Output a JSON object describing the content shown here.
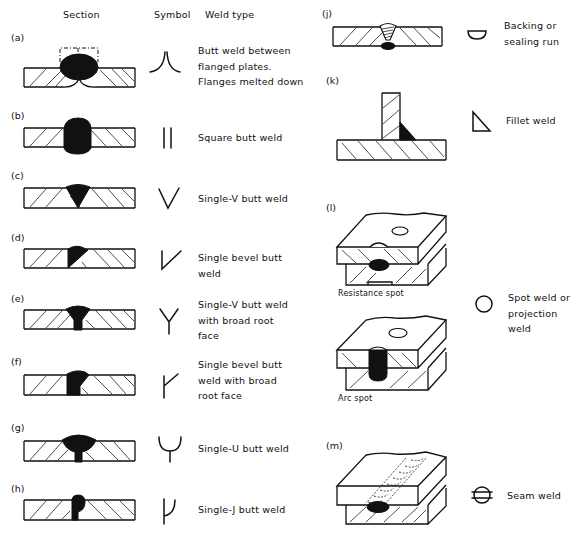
{
  "headers": {
    "section": "Section",
    "symbol": "Symbol",
    "weld_type": "Weld type"
  },
  "left_items": [
    {
      "label": "(a)",
      "symbol_icon": "flanged-butt-symbol",
      "lines": [
        "Butt weld between",
        "flanged plates.",
        "Flanges melted down"
      ]
    },
    {
      "label": "(b)",
      "symbol_icon": "square-butt-symbol",
      "lines": [
        "Square butt weld"
      ]
    },
    {
      "label": "(c)",
      "symbol_icon": "single-v-symbol",
      "lines": [
        "Single-V butt weld"
      ]
    },
    {
      "label": "(d)",
      "symbol_icon": "single-bevel-symbol",
      "lines": [
        "Single bevel butt",
        "weld"
      ]
    },
    {
      "label": "(e)",
      "symbol_icon": "single-v-broad-root-symbol",
      "lines": [
        "Single-V butt weld",
        "with broad root",
        "face"
      ]
    },
    {
      "label": "(f)",
      "symbol_icon": "single-bevel-broad-root-symbol",
      "lines": [
        "Single bevel butt",
        "weld with broad",
        "root face"
      ]
    },
    {
      "label": "(g)",
      "symbol_icon": "single-u-symbol",
      "lines": [
        "Single-U butt weld"
      ]
    },
    {
      "label": "(h)",
      "symbol_icon": "single-j-symbol",
      "lines": [
        "Single-J butt weld"
      ]
    }
  ],
  "right_items": [
    {
      "label": "(j)",
      "symbol_icon": "backing-run-symbol",
      "lines": [
        "Backing or",
        "sealing run"
      ]
    },
    {
      "label": "(k)",
      "symbol_icon": "fillet-weld-symbol",
      "lines": [
        "Fillet weld"
      ]
    },
    {
      "label": "(l)",
      "symbol_icon": "spot-weld-symbol",
      "lines": [
        "Spot weld or",
        "projection weld"
      ],
      "captions": [
        "Resistance spot",
        "Arc spot"
      ]
    },
    {
      "label": "(m)",
      "symbol_icon": "seam-weld-symbol",
      "lines": [
        "Seam weld"
      ]
    }
  ]
}
